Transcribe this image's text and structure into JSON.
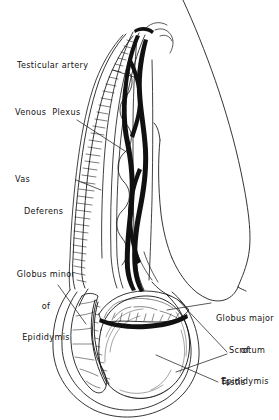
{
  "figure": {
    "style": "black-ink-line-drawing",
    "background_color": "#ffffff",
    "ink_color": "#000000",
    "width": 279,
    "height": 420
  },
  "labels": [
    {
      "id": "testicular-artery",
      "text": "Testicular artery",
      "lines": [
        "Testicular artery"
      ],
      "align": "left",
      "x": 17,
      "y": 65,
      "leader": "from label right edge to the pale coiled vessel in the upper spermatic cord"
    },
    {
      "id": "venous-plexus",
      "text": "Venous  Plexus",
      "lines": [
        "Venous  Plexus"
      ],
      "align": "left",
      "x": 15,
      "y": 112,
      "leader": "from label down-right to the dark braided veins of the pampiniform plexus"
    },
    {
      "id": "vas-deferens",
      "text": "Vas Deferens",
      "lines": [
        "Vas",
        "Deferens"
      ],
      "align": "left",
      "x": 15,
      "y": 158,
      "leader": "from label right to the hatched striated duct on the left side of the cord"
    },
    {
      "id": "globus-minor-of-epididymis",
      "text": "Globus minor of Epididymis",
      "lines": [
        "Globus minor",
        "of",
        "Epididymis"
      ],
      "align": "center",
      "x": 13,
      "y": 251,
      "leader": "from label down-right to the lobulated tail of epididymis at lower left of testis"
    },
    {
      "id": "globus-major-of-epididymis",
      "text": "Globus major of Epididymis",
      "lines": [
        "Globus major",
        "of",
        "Epididymis"
      ],
      "align": "center",
      "x": 213,
      "y": 295,
      "leader": "from label left to the head of epididymis on top of the testis"
    },
    {
      "id": "scrotum",
      "text": "Scrotum",
      "lines": [
        "Scrotum"
      ],
      "align": "left",
      "x": 229,
      "y": 348,
      "leader": "two converging leader lines to the inner and outer scrotal wall layers"
    },
    {
      "id": "testis",
      "text": "Testis",
      "lines": [
        "Testis"
      ],
      "align": "left",
      "x": 220,
      "y": 380,
      "leader": "from label left to the body of the testis"
    }
  ]
}
